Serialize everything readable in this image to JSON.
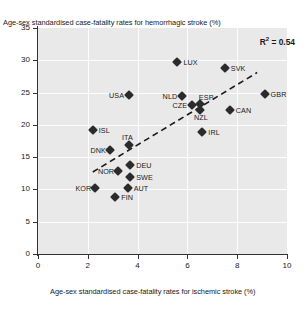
{
  "chart_data": {
    "type": "scatter",
    "title": "",
    "xlabel": "Age-sex standardised case-fatality rates for ischemic stroke (%)",
    "ylabel": "Age-sex standardised case-fatality rates for hemorrhagic stroke (%)",
    "xlim": [
      0,
      10
    ],
    "ylim": [
      0,
      35
    ],
    "xticks": [
      "0",
      "2",
      "4",
      "6",
      "8",
      "10"
    ],
    "yticks": [
      "0",
      "5",
      "10",
      "15",
      "20",
      "25",
      "30",
      "35"
    ],
    "grid": true,
    "legend": "none",
    "annotation_r2_prefix": "R",
    "annotation_r2_sup": "2",
    "annotation_r2_value": " = 0.54",
    "trendline": {
      "type": "linear-dashed",
      "x_start": 2.2,
      "y_start": 12.7,
      "x_end": 8.8,
      "y_end": 28.1
    },
    "points": [
      {
        "label": "LUX",
        "x": 5.6,
        "y": 29.7,
        "label_pos": "right"
      },
      {
        "label": "SVK",
        "x": 7.5,
        "y": 28.8,
        "label_pos": "right"
      },
      {
        "label": "GBR",
        "x": 9.1,
        "y": 24.8,
        "label_pos": "right"
      },
      {
        "label": "USA",
        "x": 3.65,
        "y": 24.6,
        "label_pos": "left"
      },
      {
        "label": "NLD",
        "x": 5.8,
        "y": 24.5,
        "label_pos": "left"
      },
      {
        "label": "ESP",
        "x": 6.5,
        "y": 23.2,
        "label_pos": "above-right"
      },
      {
        "label": "CZE",
        "x": 6.2,
        "y": 23.1,
        "label_pos": "left"
      },
      {
        "label": "NZL",
        "x": 6.5,
        "y": 22.3,
        "label_pos": "below"
      },
      {
        "label": "CAN",
        "x": 7.7,
        "y": 22.3,
        "label_pos": "right"
      },
      {
        "label": "IRL",
        "x": 6.6,
        "y": 18.9,
        "label_pos": "right"
      },
      {
        "label": "ISL",
        "x": 2.2,
        "y": 19.2,
        "label_pos": "right"
      },
      {
        "label": "ITA",
        "x": 3.65,
        "y": 16.9,
        "label_pos": "above"
      },
      {
        "label": "DNK",
        "x": 2.9,
        "y": 16.1,
        "label_pos": "left"
      },
      {
        "label": "DEU",
        "x": 3.7,
        "y": 13.8,
        "label_pos": "right"
      },
      {
        "label": "NOR",
        "x": 3.2,
        "y": 12.8,
        "label_pos": "left"
      },
      {
        "label": "SWE",
        "x": 3.7,
        "y": 11.9,
        "label_pos": "right"
      },
      {
        "label": "KOR",
        "x": 2.3,
        "y": 10.2,
        "label_pos": "left"
      },
      {
        "label": "AUT",
        "x": 3.6,
        "y": 10.2,
        "label_pos": "right"
      },
      {
        "label": "FIN",
        "x": 3.1,
        "y": 8.8,
        "label_pos": "right"
      }
    ]
  }
}
